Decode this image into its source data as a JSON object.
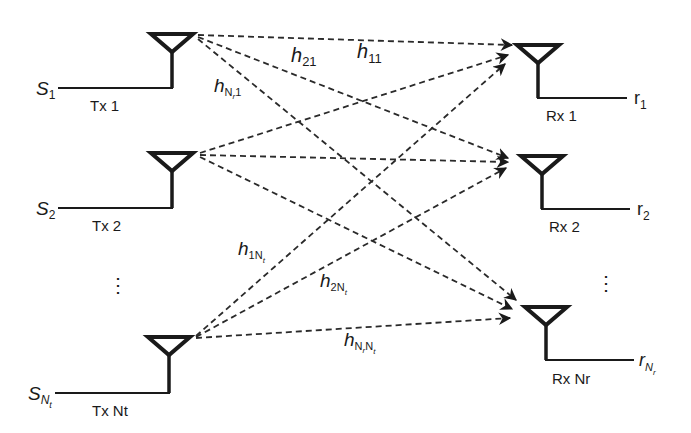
{
  "diagram": {
    "type": "MIMO channel model",
    "transmitters": [
      {
        "id": "tx1",
        "label": "Tx 1",
        "input_base": "S",
        "input_sub": "1",
        "x": 172,
        "tri_top": 34,
        "feed_y": 88,
        "feed_x0": 58
      },
      {
        "id": "tx2",
        "label": "Tx 2",
        "input_base": "S",
        "input_sub": "2",
        "x": 172,
        "tri_top": 153,
        "feed_y": 208,
        "feed_x0": 58
      },
      {
        "id": "txNt",
        "label": "Tx Nt",
        "input_base": "S",
        "input_sub": "N",
        "input_subsub": "t",
        "x": 169,
        "tri_top": 337,
        "feed_y": 393,
        "feed_x0": 55
      }
    ],
    "receivers": [
      {
        "id": "rx1",
        "label": "Rx 1",
        "output_base": "r",
        "output_sub": "1",
        "x": 538,
        "tri_top": 45,
        "feed_y": 98,
        "feed_x1": 627
      },
      {
        "id": "rx2",
        "label": "Rx 2",
        "output_base": "r",
        "output_sub": "2",
        "x": 542,
        "tri_top": 156,
        "feed_y": 209,
        "feed_x1": 630
      },
      {
        "id": "rxNr",
        "label": "Rx Nr",
        "output_base": "r",
        "output_sub": "N",
        "output_subsub": "r",
        "x": 546,
        "tri_top": 307,
        "feed_y": 360,
        "feed_x1": 634
      }
    ],
    "tx_ellipsis": "⋮",
    "rx_ellipsis": "⋮",
    "channel_labels": [
      {
        "id": "h11",
        "base": "h",
        "sub": "11"
      },
      {
        "id": "h21",
        "base": "h",
        "sub": "21"
      },
      {
        "id": "hNr1",
        "base": "h",
        "sub": "N",
        "subsub": "r",
        "tail": "1"
      },
      {
        "id": "h1Nt",
        "base": "h",
        "sub": "1N",
        "subsub": "t"
      },
      {
        "id": "h2Nt",
        "base": "h",
        "sub": "2N",
        "subsub": "t"
      },
      {
        "id": "hNrNt",
        "base": "h",
        "sub": "N",
        "subsub": "r",
        "tail": "N",
        "tailsub": "t"
      }
    ],
    "colors": {
      "ink": "#1a1a1a",
      "background": "#ffffff"
    }
  }
}
